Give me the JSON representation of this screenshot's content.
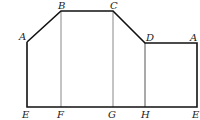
{
  "diagram": {
    "type": "geometric-net",
    "outline_color": "#111111",
    "inner_line_color": "#888888",
    "points": [
      {
        "id": "A_left",
        "label": "A",
        "x": 27,
        "y": 42,
        "lx": 19,
        "ly": 40
      },
      {
        "id": "B",
        "label": "B",
        "x": 61,
        "y": 11,
        "lx": 58,
        "ly": 9
      },
      {
        "id": "C",
        "label": "C",
        "x": 113,
        "y": 11,
        "lx": 110,
        "ly": 9
      },
      {
        "id": "D",
        "label": "D",
        "x": 145,
        "y": 43,
        "lx": 146,
        "ly": 41
      },
      {
        "id": "A_right",
        "label": "A",
        "x": 197,
        "y": 43,
        "lx": 190,
        "ly": 41
      },
      {
        "id": "E_left",
        "label": "E",
        "x": 27,
        "y": 107,
        "lx": 22,
        "ly": 118
      },
      {
        "id": "F",
        "label": "F",
        "x": 61,
        "y": 107,
        "lx": 57,
        "ly": 118
      },
      {
        "id": "G",
        "label": "G",
        "x": 113,
        "y": 107,
        "lx": 108,
        "ly": 118
      },
      {
        "id": "H",
        "label": "H",
        "x": 145,
        "y": 107,
        "lx": 141,
        "ly": 118
      },
      {
        "id": "E_right",
        "label": "E",
        "x": 197,
        "y": 107,
        "lx": 192,
        "ly": 118
      }
    ],
    "labels": {
      "A_left": "A",
      "B": "B",
      "C": "C",
      "D": "D",
      "A_right": "A",
      "E_left": "E",
      "F": "F",
      "G": "G",
      "H": "H",
      "E_right": "E"
    }
  }
}
